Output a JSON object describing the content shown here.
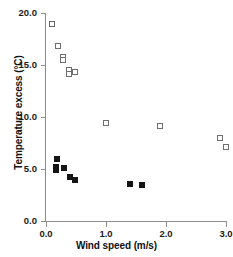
{
  "chart_data": {
    "type": "scatter",
    "title": "",
    "xlabel": "Wind speed (m/s)",
    "ylabel": "Temperature excess (°C)",
    "xlim": [
      0.0,
      3.05
    ],
    "ylim": [
      0.0,
      20.0
    ],
    "grid": false,
    "legend": null,
    "xticks": [
      "0.0",
      "1.0",
      "2.0",
      "3.0"
    ],
    "xtick_values": [
      0.0,
      1.0,
      2.0,
      3.0
    ],
    "yticks": [
      "0.0",
      "5.0",
      "10.0",
      "15.0",
      "20.0"
    ],
    "ytick_values": [
      0.0,
      5.0,
      10.0,
      15.0,
      20.0
    ],
    "series": [
      {
        "name": "open-squares",
        "marker": "open-square",
        "color": "#6e6e6e",
        "points": [
          {
            "x": 0.1,
            "y": 18.9
          },
          {
            "x": 0.2,
            "y": 16.8
          },
          {
            "x": 0.28,
            "y": 15.8
          },
          {
            "x": 0.28,
            "y": 15.5
          },
          {
            "x": 0.38,
            "y": 14.5
          },
          {
            "x": 0.38,
            "y": 14.1
          },
          {
            "x": 0.48,
            "y": 14.3
          },
          {
            "x": 1.0,
            "y": 9.4
          },
          {
            "x": 1.9,
            "y": 9.1
          },
          {
            "x": 2.9,
            "y": 8.0
          },
          {
            "x": 3.0,
            "y": 7.1
          }
        ]
      },
      {
        "name": "filled-squares",
        "marker": "filled-square",
        "color": "#141414",
        "points": [
          {
            "x": 0.18,
            "y": 6.0
          },
          {
            "x": 0.17,
            "y": 5.2
          },
          {
            "x": 0.17,
            "y": 4.9
          },
          {
            "x": 0.3,
            "y": 5.1
          },
          {
            "x": 0.4,
            "y": 4.2
          },
          {
            "x": 0.48,
            "y": 3.95
          },
          {
            "x": 1.4,
            "y": 3.6
          },
          {
            "x": 1.6,
            "y": 3.5
          }
        ]
      }
    ]
  }
}
